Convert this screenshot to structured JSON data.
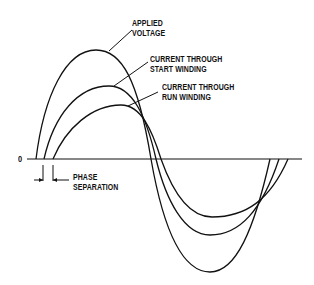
{
  "diagram": {
    "type": "waveform",
    "zero_label": "0",
    "labels": {
      "applied_voltage": [
        "APPLIED",
        "VOLTAGE"
      ],
      "start_winding": [
        "CURRENT THROUGH",
        "START WINDING"
      ],
      "run_winding": [
        "CURRENT THROUGH",
        "RUN WINDING"
      ],
      "phase_separation": [
        "PHASE",
        "SEPARATION"
      ]
    },
    "curves": [
      {
        "name": "Applied Voltage",
        "start_x": 36,
        "peak": [
          96,
          50
        ],
        "zero_cross_x": 151,
        "trough": [
          210,
          272
        ],
        "end_x": 270
      },
      {
        "name": "Current Through Start Winding",
        "start_x": 44,
        "peak": [
          109,
          86
        ],
        "zero_cross_x": 156,
        "trough": [
          210,
          235
        ],
        "end_x": 279
      },
      {
        "name": "Current Through Run Winding",
        "start_x": 53,
        "peak": [
          121,
          105
        ],
        "zero_cross_x": 161,
        "trough": [
          212,
          217
        ],
        "end_x": 288
      }
    ],
    "colors": {
      "line": "#111111",
      "background": "#ffffff"
    }
  }
}
